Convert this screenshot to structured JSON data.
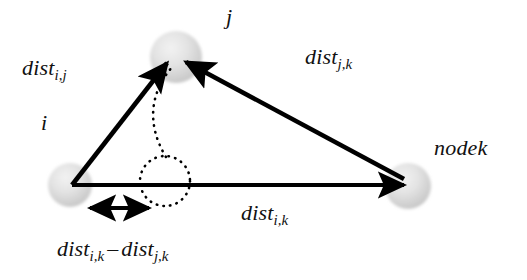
{
  "figure": {
    "type": "geometric-diagram",
    "background_color": "#ffffff",
    "stroke_color": "#000000",
    "node_fill_color": "#d9d9d9"
  },
  "nodes": [
    {
      "id": "i",
      "label": "i",
      "cx": 70,
      "cy": 185,
      "r": 22
    },
    {
      "id": "j",
      "label": "j",
      "cx": 176,
      "cy": 57,
      "r": 26
    },
    {
      "id": "k",
      "label": "nodek",
      "cx": 408,
      "cy": 186,
      "r": 23
    }
  ],
  "labels": {
    "dist_ij": {
      "base": "dist",
      "sub": "i,j"
    },
    "dist_jk": {
      "base": "dist",
      "sub": "j,k"
    },
    "dist_ik": {
      "base": "dist",
      "sub": "i,k"
    },
    "node_i": "i",
    "node_j": "j",
    "node_k": "nodek",
    "difference": {
      "left_base": "dist",
      "left_sub": "i,k",
      "operator": "–",
      "right_base": "dist",
      "right_sub": "j,k"
    }
  },
  "edges": [
    {
      "id": "i-to-j",
      "from": "i",
      "to": "j",
      "style": "solid",
      "arrow": "end",
      "label": "dist_ij"
    },
    {
      "id": "k-to-j",
      "from": "k",
      "to": "j",
      "style": "solid",
      "arrow": "end",
      "label": "dist_jk"
    },
    {
      "id": "i-to-k",
      "from": "i",
      "to": "k",
      "style": "solid",
      "arrow": "end",
      "label": "dist_ik"
    },
    {
      "id": "difference-span",
      "style": "solid",
      "arrow": "both",
      "label": "difference",
      "x1": 87,
      "y1": 208,
      "x2": 152,
      "y2": 208
    }
  ],
  "annotations": [
    {
      "id": "radius-circle",
      "style": "dotted",
      "cx": 165,
      "cy": 181,
      "r": 25
    },
    {
      "id": "arc-to-j",
      "style": "dotted",
      "from_x": 165,
      "from_y": 156,
      "to_x": 172,
      "to_y": 68
    }
  ]
}
